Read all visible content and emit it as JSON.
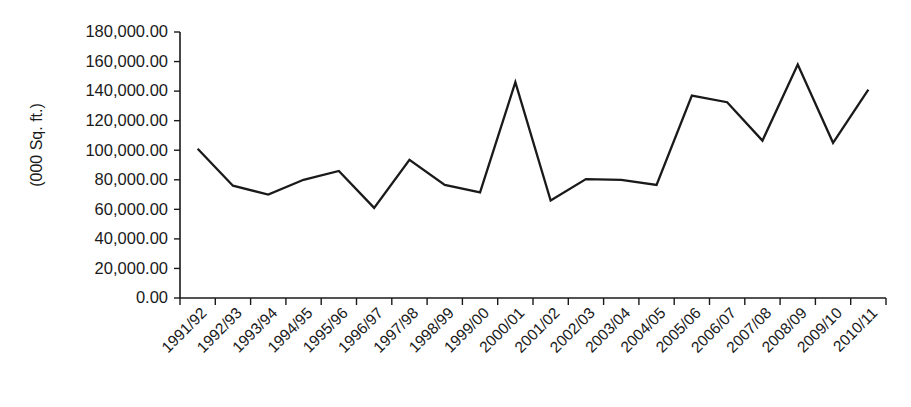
{
  "chart_data": {
    "type": "line",
    "title": "",
    "xlabel": "",
    "ylabel": "(000 Sq. ft.)",
    "grid": false,
    "legend": false,
    "ylim": [
      0,
      180000
    ],
    "ytick_values": [
      0,
      20000,
      40000,
      60000,
      80000,
      100000,
      120000,
      140000,
      160000,
      180000
    ],
    "ytick_labels": [
      "0.00",
      "20,000.00",
      "40,000.00",
      "60,000.00",
      "80,000.00",
      "100,000.00",
      "120,000.00",
      "140,000.00",
      "160,000.00",
      "180,000.00"
    ],
    "categories": [
      "1991/92",
      "1992/93",
      "1993/94",
      "1994/95",
      "1995/96",
      "1996/97",
      "1997/98",
      "1998/99",
      "1999/00",
      "2000/01",
      "2001/02",
      "2002/03",
      "2003/04",
      "2004/05",
      "2005/06",
      "2006/07",
      "2007/08",
      "2008/09",
      "2009/10",
      "2010/11"
    ],
    "values": [
      101000,
      76000,
      70000,
      80000,
      86000,
      61000,
      93500,
      76500,
      71500,
      146000,
      66000,
      80500,
      80000,
      76500,
      137000,
      132500,
      106500,
      158000,
      105000,
      141000
    ],
    "series": [
      {
        "name": "",
        "color": "#1a1a1a",
        "values": [
          101000,
          76000,
          70000,
          80000,
          86000,
          61000,
          93500,
          76500,
          71500,
          146000,
          66000,
          80500,
          80000,
          76500,
          137000,
          132500,
          106500,
          158000,
          105000,
          141000
        ]
      }
    ]
  },
  "axes": {
    "y_axis_title": "(000 Sq. ft.)",
    "line_color": "#1a1a1a",
    "text_color": "#1a1a1a",
    "background_color": "#ffffff"
  }
}
